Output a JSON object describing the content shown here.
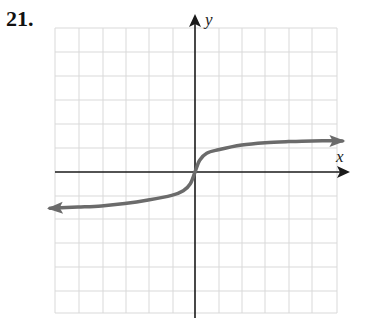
{
  "problem": {
    "number": "21."
  },
  "graph": {
    "x_axis_label": "x",
    "y_axis_label": "y",
    "grid": {
      "x_lines": [
        55,
        79,
        103,
        126,
        149,
        173,
        219,
        242,
        265,
        289,
        312,
        337
      ],
      "y_lines": [
        28,
        52,
        76,
        100,
        124,
        148,
        196,
        219,
        243,
        267,
        291,
        313
      ]
    },
    "origin_px": [
      195,
      172
    ],
    "unit_px": 23.4,
    "curve_description": "increasing S-shaped curve through the origin with vertical tangent at origin, arrows at both ends",
    "colors": {
      "curve": "#6b6b6b",
      "axis": "#1a1a1a",
      "grid": "#d9d9d9"
    }
  },
  "chart_data": {
    "type": "line",
    "title": "21.",
    "xlabel": "x",
    "ylabel": "y",
    "grid": true,
    "xlim": [
      -6,
      6.5
    ],
    "ylim": [
      -6,
      6.5
    ],
    "series": [
      {
        "name": "curve",
        "x": [
          -6.2,
          -5,
          -4,
          -3,
          -2,
          -1,
          -0.5,
          -0.2,
          0,
          0.2,
          0.5,
          1,
          2,
          3,
          4,
          5,
          6.3
        ],
        "y": [
          -1.55,
          -1.5,
          -1.45,
          -1.35,
          -1.2,
          -1.0,
          -0.8,
          -0.5,
          0,
          0.5,
          0.8,
          0.95,
          1.15,
          1.25,
          1.3,
          1.33,
          1.33
        ]
      }
    ]
  }
}
